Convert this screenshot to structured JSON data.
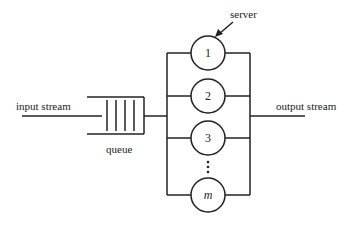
{
  "labels": {
    "input": "input stream",
    "output": "output stream",
    "queue": "queue",
    "server": "server"
  },
  "servers": [
    {
      "label": "1",
      "cy": 53
    },
    {
      "label": "2",
      "cy": 96
    },
    {
      "label": "3",
      "cy": 138
    },
    {
      "label": "m",
      "cy": 195,
      "italic": true
    }
  ],
  "ellipsis": "⋮",
  "colors": {
    "stroke": "#222222",
    "background": "#ffffff"
  }
}
